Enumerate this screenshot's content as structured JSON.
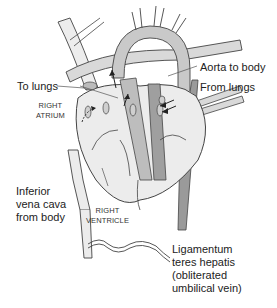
{
  "diagram": {
    "type": "anatomical-illustration",
    "colors": {
      "line": "#444444",
      "vessel_fill": "#d9d9d9",
      "vessel_dark": "#9a9a9a",
      "heart_fill": "#ececec",
      "background": "#ffffff"
    },
    "labels": {
      "to_lungs": "To lungs",
      "aorta_to_body": "Aorta to body",
      "from_lungs": "From lungs",
      "right_atrium": "RIGHT\nATRIUM",
      "right_ventricle": "RIGHT\nVENTRICLE",
      "inferior_vena_cava": "Inferior\nvena cava\nfrom body",
      "ligamentum": "Ligamentum\nteres hepatis\n(obliterated\numbilical vein)"
    }
  }
}
